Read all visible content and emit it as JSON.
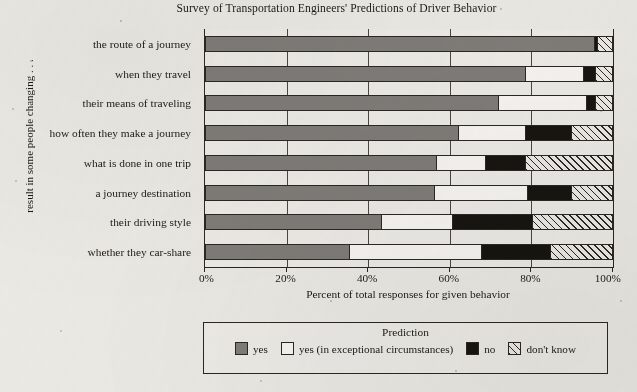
{
  "chart_data": {
    "type": "bar",
    "orientation": "horizontal",
    "stacked": true,
    "normalized": true,
    "title": "Survey of Transportation Engineers' Predictions of Driver Behavior",
    "xlabel": "Percent of total responses for given behavior",
    "ylabel": "result in some people changing . . .",
    "xlim": [
      0,
      100
    ],
    "xticks": [
      0,
      20,
      40,
      60,
      80,
      100
    ],
    "xtick_labels": [
      "0%",
      "20%",
      "40%",
      "60%",
      "80%",
      "100%"
    ],
    "grid": "vertical",
    "legend_title": "Prediction",
    "legend_position": "below",
    "categories": [
      "the route of a journey",
      "when they travel",
      "their means of traveling",
      "how often they make a journey",
      "what is done in one trip",
      "a journey destination",
      "their driving style",
      "whether they car-share"
    ],
    "series": [
      {
        "name": "yes",
        "color": "#807d79",
        "fill": "solid",
        "values": [
          95.3,
          78.4,
          71.8,
          62.0,
          56.6,
          56.1,
          43.1,
          35.3
        ]
      },
      {
        "name": "yes (in exceptional circumstances)",
        "color": "#f7f6f2",
        "fill": "solid",
        "values": [
          0.0,
          14.2,
          21.6,
          16.4,
          12.0,
          22.8,
          17.4,
          32.3
        ]
      },
      {
        "name": "no",
        "color": "#17150f",
        "fill": "solid",
        "values": [
          0.7,
          2.9,
          2.2,
          11.3,
          9.8,
          10.8,
          19.6,
          17.0
        ]
      },
      {
        "name": "don't know",
        "color": "#edebe5",
        "fill": "hatched",
        "values": [
          4.0,
          4.5,
          4.4,
          10.3,
          21.6,
          10.3,
          19.9,
          15.4
        ]
      }
    ]
  },
  "legend": {
    "title": "Prediction",
    "items": [
      {
        "label": "yes",
        "style": "yes"
      },
      {
        "label": "yes (in exceptional circumstances)",
        "style": "yesexc"
      },
      {
        "label": "no",
        "style": "no"
      },
      {
        "label": "don't know",
        "style": "dontknow"
      }
    ]
  }
}
